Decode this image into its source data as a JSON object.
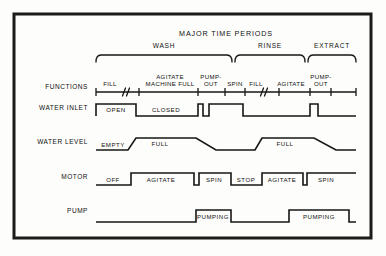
{
  "diagram": {
    "title": "MAJOR TIME PERIODS",
    "frame": {
      "x": 14,
      "y": 14,
      "width": 357,
      "height": 224,
      "color": "#1b1b1b"
    },
    "ink_color": "#161616",
    "background": "#fdfdfb"
  },
  "periods": [
    {
      "label": "WASH",
      "x1": 96,
      "x2": 232,
      "label_x": 164,
      "label_y": 48
    },
    {
      "label": "RINSE",
      "x1": 235,
      "x2": 305,
      "label_x": 270,
      "label_y": 48
    },
    {
      "label": "EXTRACT",
      "x1": 308,
      "x2": 356,
      "label_x": 332,
      "label_y": 48
    }
  ],
  "rows": [
    {
      "name": "functions",
      "label": "FUNCTIONS",
      "label_x": 88,
      "label_y": 89
    },
    {
      "name": "water-inlet",
      "label": "WATER INLET",
      "label_x": 88,
      "label_y": 110
    },
    {
      "name": "water-level",
      "label": "WATER LEVEL",
      "label_x": 88,
      "label_y": 144
    },
    {
      "name": "motor",
      "label": "MOTOR",
      "label_x": 88,
      "label_y": 179
    },
    {
      "name": "pump",
      "label": "PUMP",
      "label_x": 88,
      "label_y": 213
    }
  ],
  "functions_axis": {
    "x1": 96,
    "x2": 356,
    "y": 92,
    "ticks": [
      96,
      139,
      198,
      225,
      245,
      279,
      310,
      331,
      356
    ],
    "breaks": [
      {
        "x": 124,
        "y": 92
      },
      {
        "x": 262,
        "y": 92
      }
    ],
    "labels": [
      {
        "text": "FILL",
        "x": 110,
        "y": 86
      },
      {
        "text": "AGITATE",
        "x": 170,
        "y": 79
      },
      {
        "text": "MACHINE FULL",
        "x": 170,
        "y": 86
      },
      {
        "text": "PUMP-",
        "x": 211,
        "y": 79
      },
      {
        "text": "OUT",
        "x": 211,
        "y": 86
      },
      {
        "text": "SPIN",
        "x": 235,
        "y": 86
      },
      {
        "text": "FILL",
        "x": 256,
        "y": 86
      },
      {
        "text": "AGITATE",
        "x": 291,
        "y": 86
      },
      {
        "text": "PUMP-",
        "x": 321,
        "y": 79
      },
      {
        "text": "OUT",
        "x": 321,
        "y": 86
      }
    ]
  },
  "waveforms": {
    "water_inlet": {
      "baseline_y": 116,
      "high_y": 104,
      "path": "M 96,116 L 96,104 L 136,104 L 136,116 L 198,116 L 198,104 L 203,104 L 203,116 L 209,116 L 209,104 L 243,104 L 243,116 L 310,116 L 310,104 L 318,104 L 318,116 L 356,116",
      "states": [
        {
          "text": "OPEN",
          "x": 116,
          "y": 112,
          "boxed": false
        },
        {
          "text": "CLOSED",
          "x": 166,
          "y": 112,
          "boxed": false
        }
      ]
    },
    "water_level": {
      "baseline_y": 150,
      "high_y": 138,
      "path": "M 96,150 L 128,150 L 136,138 L 196,138 L 216,150 L 255,150 L 262,138 L 314,138 L 336,150 L 356,150",
      "states": [
        {
          "text": "EMPTY",
          "x": 113,
          "y": 147,
          "boxed": false
        },
        {
          "text": "FULL",
          "x": 160,
          "y": 146,
          "boxed": false
        },
        {
          "text": "FULL",
          "x": 285,
          "y": 146,
          "boxed": false
        }
      ]
    },
    "motor": {
      "baseline_y": 185,
      "high_y": 173,
      "path": "M 96,185 L 131,185 L 131,173 L 194,173 L 194,185 L 199,185 L 199,173 L 231,173 L 231,185 L 262,185 L 262,173 L 303,173 L 303,185 L 307,185 L 307,173 L 356,173",
      "states": [
        {
          "text": "OFF",
          "x": 113,
          "y": 182,
          "boxed": false
        },
        {
          "text": "AGITATE",
          "x": 161,
          "y": 182,
          "boxed": false
        },
        {
          "text": "SPIN",
          "x": 214,
          "y": 182,
          "boxed": false
        },
        {
          "text": "STOP",
          "x": 246,
          "y": 182,
          "boxed": false
        },
        {
          "text": "AGITATE",
          "x": 282,
          "y": 182,
          "boxed": true
        },
        {
          "text": "SPIN",
          "x": 326,
          "y": 182,
          "boxed": false
        }
      ]
    },
    "pump": {
      "baseline_y": 222,
      "high_y": 210,
      "path": "M 96,222 L 196,222 L 196,210 L 231,210 L 231,222 L 289,222 L 289,210 L 349,210 L 349,222 L 356,222",
      "states": [
        {
          "text": "PUMPING",
          "x": 213,
          "y": 219,
          "boxed": true
        },
        {
          "text": "PUMPING",
          "x": 319,
          "y": 219,
          "boxed": false
        }
      ]
    }
  }
}
